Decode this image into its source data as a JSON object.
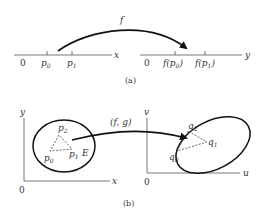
{
  "figure": {
    "part_a": {
      "caption": "(a)",
      "mapping_label": "f",
      "left_axis": {
        "axis_label": "x",
        "origin_label": "0",
        "points": [
          {
            "base": "p",
            "sub": "0"
          },
          {
            "base": "p",
            "sub": "1"
          }
        ]
      },
      "right_axis": {
        "axis_label": "y",
        "origin_label": "0",
        "points": [
          {
            "prefix": "f(",
            "base": "p",
            "sub": "0",
            "suffix": ")"
          },
          {
            "prefix": "f(",
            "base": "p",
            "sub": "1",
            "suffix": ")"
          }
        ]
      }
    },
    "part_b": {
      "caption": "(b)",
      "mapping_label": "(f, g)",
      "left_plane": {
        "x_label": "x",
        "y_label": "y",
        "origin_label": "0",
        "region_label": "E",
        "points": [
          {
            "base": "p",
            "sub": "0"
          },
          {
            "base": "p",
            "sub": "1"
          },
          {
            "base": "p",
            "sub": "2"
          }
        ]
      },
      "right_plane": {
        "x_label": "u",
        "y_label": "v",
        "origin_label": "0",
        "points": [
          {
            "base": "q",
            "sub": "0"
          },
          {
            "base": "q",
            "sub": "1"
          },
          {
            "base": "q",
            "sub": "2"
          }
        ]
      }
    }
  }
}
